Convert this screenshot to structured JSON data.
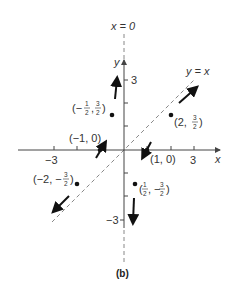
{
  "figure": {
    "caption": "(b)",
    "line_x0_label": "x = 0",
    "line_yx_label": "y = x",
    "x_axis_label": "x",
    "y_axis_label": "y",
    "x_ticks": [
      "-3",
      "3"
    ],
    "y_ticks": [
      "3",
      "-3"
    ],
    "points": [
      {
        "id": "p1",
        "label": "(-1/2, 3/2)",
        "x": -0.5,
        "y": 1.5,
        "arrow": "up"
      },
      {
        "id": "p2",
        "label": "(2, 3/2)",
        "x": 2,
        "y": 1.5,
        "arrow": "up-right"
      },
      {
        "id": "p3",
        "label": "(-2, -3/2)",
        "x": -2,
        "y": -1.5,
        "arrow": "down-left"
      },
      {
        "id": "p4",
        "label": "(1/2, -3/2)",
        "x": 0.5,
        "y": -1.5,
        "arrow": "down"
      },
      {
        "id": "p5",
        "label": "(-1, 0)",
        "x": -1,
        "y": 0,
        "arrow": "up-right"
      },
      {
        "id": "p6",
        "label": "(1, 0)",
        "x": 1,
        "y": 0,
        "arrow": "down-left"
      }
    ],
    "labels": {
      "p1_prefix": "(−",
      "p1_n1": "1",
      "p1_d1": "2",
      "p1_n2": "3",
      "p1_d2": "2",
      "p2_prefix": "(2, ",
      "p2_n": "3",
      "p2_d": "2",
      "p3_prefix": "(−2, −",
      "p3_n": "3",
      "p3_d": "2",
      "p4_n1": "1",
      "p4_d1": "2",
      "p4_mid": ", −",
      "p4_n2": "3",
      "p4_d2": "2",
      "p5": "(−1, 0)",
      "p6": "(1, 0)",
      "comma": ",",
      "close": ")",
      "open": "("
    },
    "x_tick_neg": "−3",
    "x_tick_pos": "3",
    "y_tick_pos": "3",
    "y_tick_neg": "−3"
  }
}
